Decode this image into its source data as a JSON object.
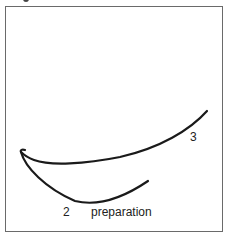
{
  "figure": {
    "labels": {
      "curve_upper": "3",
      "curve_lower": "2",
      "caption": "preparation"
    },
    "stroke_color": "#1a1a1a",
    "frame_color": "#6a6a6a"
  }
}
